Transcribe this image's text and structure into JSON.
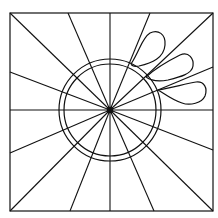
{
  "diagram": {
    "type": "line-drawing",
    "stroke_color": "#111111",
    "background": "#ffffff",
    "frame": {
      "x": 10,
      "y": 13,
      "width": 203,
      "height": 198
    },
    "center": {
      "x": 110,
      "y": 110
    },
    "circles": [
      {
        "r": 51
      },
      {
        "r": 46
      }
    ],
    "spoke_endpoints": [
      [
        10,
        13
      ],
      [
        68,
        13
      ],
      [
        110,
        13
      ],
      [
        150,
        13
      ],
      [
        213,
        13
      ],
      [
        213,
        67
      ],
      [
        213,
        110
      ],
      [
        213,
        150
      ],
      [
        213,
        211
      ],
      [
        154,
        211
      ],
      [
        110,
        211
      ],
      [
        70,
        211
      ],
      [
        10,
        211
      ],
      [
        10,
        153
      ],
      [
        10,
        110
      ],
      [
        10,
        72
      ]
    ],
    "loops": [
      {
        "name": "loop-top",
        "d": "M131,64 C140,50 142,38 150,33 C158,29 166,34 165,45 C164,58 152,63 139,66 C134,67 132,66 131,64"
      },
      {
        "name": "loop-middle",
        "d": "M146,77 C158,66 170,60 180,55 C189,51 194,59 193,66 C192,74 180,77 168,80 C158,82 150,80 146,77"
      },
      {
        "name": "loop-bottom",
        "d": "M158,90 C170,88 185,84 196,82 C204,81 208,88 205,96 C202,103 190,106 182,103 C172,100 165,94 158,90"
      }
    ]
  }
}
